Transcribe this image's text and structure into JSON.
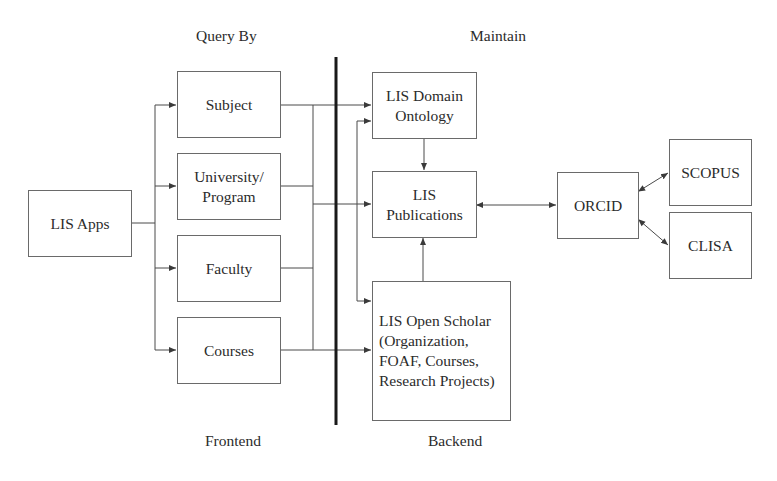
{
  "diagram": {
    "section_labels": {
      "query_by": "Query By",
      "maintain": "Maintain",
      "frontend": "Frontend",
      "backend": "Backend"
    },
    "nodes": {
      "lis_apps": "LIS Apps",
      "subject": "Subject",
      "university_program": "University/\nProgram",
      "faculty": "Faculty",
      "courses": "Courses",
      "lis_domain_ontology": "LIS Domain\nOntology",
      "lis_publications": "LIS\nPublications",
      "lis_open_scholar": "LIS Open Scholar\n(Organization,\nFOAF, Courses,\nResearch Projects)",
      "orcid": "ORCID",
      "scopus": "SCOPUS",
      "clisa": "CLISA"
    },
    "edges": [
      {
        "from": "LIS Apps",
        "to": "Subject",
        "direction": "forward"
      },
      {
        "from": "LIS Apps",
        "to": "University/Program",
        "direction": "forward"
      },
      {
        "from": "LIS Apps",
        "to": "Faculty",
        "direction": "forward"
      },
      {
        "from": "LIS Apps",
        "to": "Courses",
        "direction": "forward"
      },
      {
        "from": "Query By group",
        "to": "LIS Domain Ontology",
        "direction": "forward"
      },
      {
        "from": "Query By group",
        "to": "LIS Publications",
        "direction": "forward"
      },
      {
        "from": "Query By group",
        "to": "LIS Open Scholar",
        "direction": "forward"
      },
      {
        "from": "Backend trunk",
        "to": "LIS Domain Ontology",
        "direction": "forward"
      },
      {
        "from": "Backend trunk",
        "to": "LIS Open Scholar",
        "direction": "forward"
      },
      {
        "from": "LIS Domain Ontology",
        "to": "LIS Publications",
        "direction": "forward"
      },
      {
        "from": "LIS Open Scholar",
        "to": "LIS Publications",
        "direction": "forward"
      },
      {
        "from": "LIS Publications",
        "to": "ORCID",
        "direction": "bidirectional"
      },
      {
        "from": "ORCID",
        "to": "SCOPUS",
        "direction": "bidirectional"
      },
      {
        "from": "ORCID",
        "to": "CLISA",
        "direction": "bidirectional"
      }
    ],
    "colors": {
      "line": "#4a4a4a",
      "divider": "#1a1a1a",
      "box_border": "#6a6a6a",
      "text": "#2b2b2b",
      "background": "#ffffff"
    }
  }
}
